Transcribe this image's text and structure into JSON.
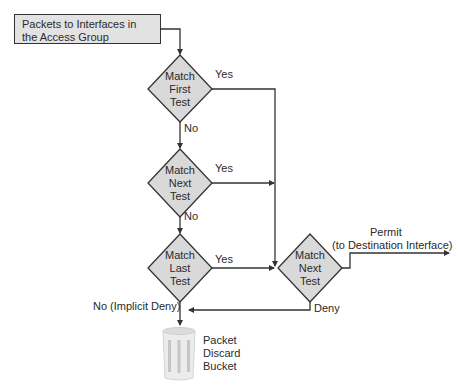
{
  "start": {
    "label_line1": "Packets to Interfaces in",
    "label_line2": "the Access Group"
  },
  "decisions": [
    {
      "id": "match-first-test",
      "lines": [
        "Match",
        "First",
        "Test"
      ],
      "yes": "Yes",
      "no": "No"
    },
    {
      "id": "match-next-test-1",
      "lines": [
        "Match",
        "Next",
        "Test"
      ],
      "yes": "Yes",
      "no": "No"
    },
    {
      "id": "match-last-test",
      "lines": [
        "Match",
        "Last",
        "Test"
      ],
      "yes": "Yes",
      "no": "No (Implicit Deny)"
    },
    {
      "id": "match-next-test-2",
      "lines": [
        "Match",
        "Next",
        "Test"
      ],
      "permit": "Permit",
      "permit_sub": "(to Destination Interface)",
      "deny": "Deny"
    }
  ],
  "bucket": {
    "lines": [
      "Packet",
      "Discard",
      "Bucket"
    ]
  },
  "colors": {
    "diamond_fill": "#d9d9d9",
    "box_fill": "#e2e2e2",
    "line": "#333333"
  }
}
